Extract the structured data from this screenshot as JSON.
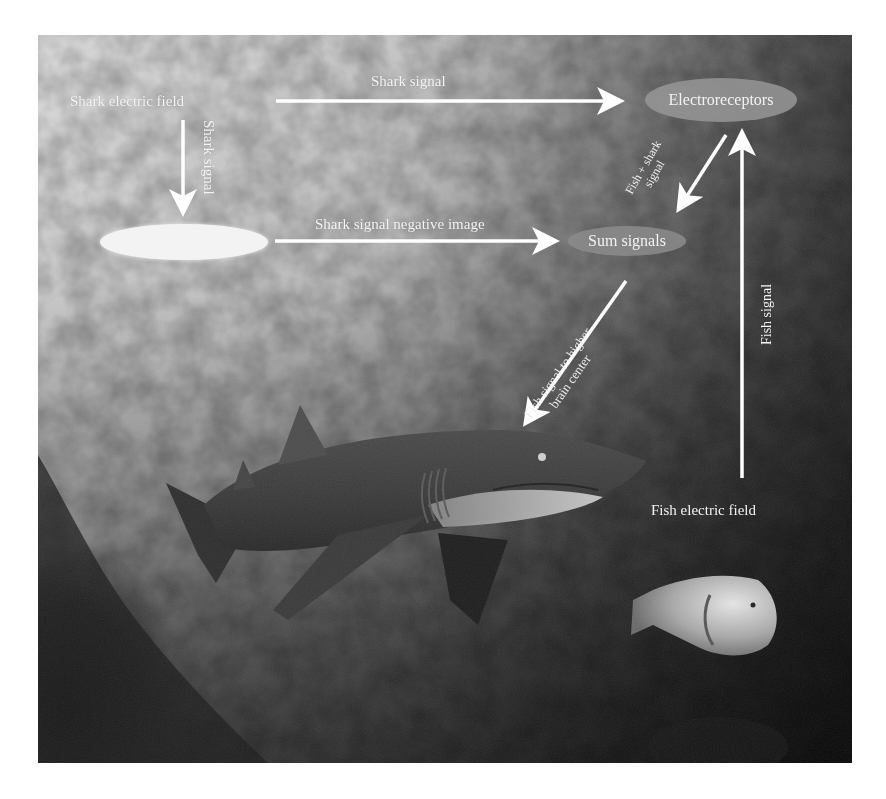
{
  "figure": {
    "colors": {
      "arrow": "#ffffff",
      "label_text": "#f4f4f4",
      "blank_node_fill": "#f2f2f2",
      "electroreceptors_node_fill": "#9a9a9a",
      "sum_node_fill": "#8e8e8e"
    }
  },
  "nodes": {
    "shark_field": "Shark electric field",
    "electroreceptors": "Electroreceptors",
    "negative_image": "",
    "sum_signals": "Sum signals",
    "fish_field": "Fish electric field"
  },
  "edges": {
    "shark_to_receptors": "Shark signal",
    "shark_to_negative": "Shark signal",
    "negative_to_sum": "Shark signal negative image",
    "receptors_to_sum": "Fish + shark signal",
    "receptors_to_sum_line1": "Fish + shark",
    "receptors_to_sum_line2": "signal",
    "sum_to_brain_line1": "Fish signal to higher",
    "sum_to_brain_line2": "brain center",
    "fish_to_receptors": "Fish signal"
  }
}
